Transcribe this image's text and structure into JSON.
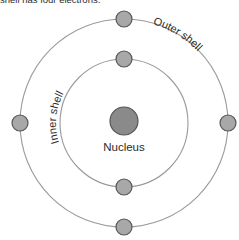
{
  "caption": {
    "text": "shell has four electrons."
  },
  "diagram": {
    "title_labels": {
      "nucleus": "Nucleus",
      "inner_shell": "Inner shell",
      "outer_shell": "Outer shell"
    },
    "colors": {
      "background": "#ffffff",
      "nucleus_fill": "#8a8a8a",
      "nucleus_stroke": "#555555",
      "electron_fill": "#a8a8a8",
      "electron_stroke": "#555555",
      "shell_stroke": "#9a9a9a",
      "text": "#2b2b2b"
    },
    "geometry": {
      "center_x": 124,
      "center_y": 123,
      "outer_shell_radius": 104,
      "inner_shell_radius": 64,
      "nucleus_radius": 14,
      "electron_radius": 8
    },
    "shells": [
      {
        "name": "inner shell",
        "label": "Inner shell",
        "radius": 64,
        "electron_count": 2,
        "electrons": [
          {
            "position": "top",
            "cx": 124,
            "cy": 59
          },
          {
            "position": "bottom",
            "cx": 124,
            "cy": 187
          }
        ]
      },
      {
        "name": "outer shell",
        "label": "Outer shell",
        "radius": 104,
        "electron_count": 4,
        "electrons": [
          {
            "position": "top",
            "cx": 124,
            "cy": 19
          },
          {
            "position": "right",
            "cx": 228,
            "cy": 123
          },
          {
            "position": "bottom",
            "cx": 124,
            "cy": 227
          },
          {
            "position": "left",
            "cx": 20,
            "cy": 123
          }
        ]
      }
    ]
  }
}
